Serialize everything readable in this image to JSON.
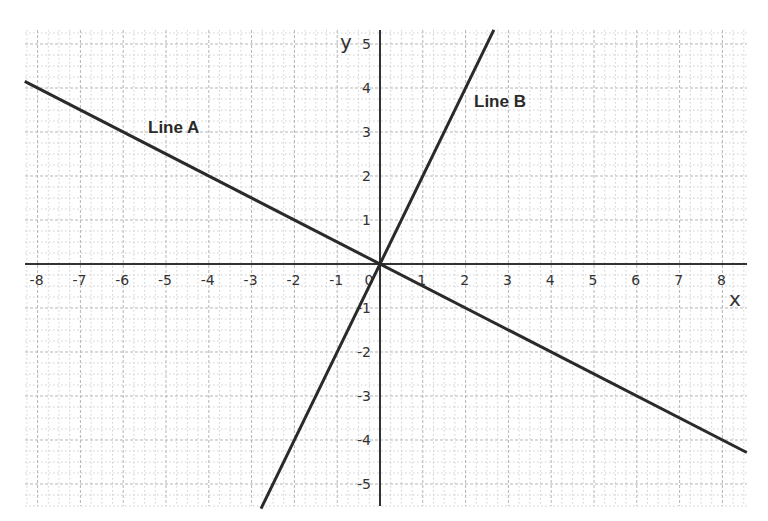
{
  "chart_data": {
    "type": "line",
    "title": "",
    "xlabel": "x",
    "ylabel": "y",
    "xlim": [
      -8.3,
      8.57
    ],
    "ylim": [
      -5.5,
      5.3
    ],
    "grid": true,
    "grid_minor_subdivisions": 4,
    "x_ticks": [
      -8,
      -7,
      -6,
      -5,
      -4,
      -3,
      -2,
      -1,
      0,
      1,
      2,
      3,
      4,
      5,
      6,
      7,
      8
    ],
    "y_ticks": [
      -5,
      -4,
      -3,
      -2,
      -1,
      1,
      2,
      3,
      4,
      5
    ],
    "legend": "none (inline labels)",
    "series": [
      {
        "name": "Line A",
        "equation": "y = -0.5x",
        "slope": -0.5,
        "intercept": 0,
        "x": [
          -8.3,
          8.57
        ],
        "y": [
          4.15,
          -4.285
        ],
        "label_pos": [
          -4.6,
          3.1
        ]
      },
      {
        "name": "Line B",
        "equation": "y = 2x",
        "slope": 2,
        "intercept": 0,
        "x": [
          -2.78,
          2.66
        ],
        "y": [
          -5.56,
          5.32
        ],
        "label_pos": [
          3.0,
          3.8
        ]
      }
    ],
    "annotations": [
      "Line A",
      "Line B"
    ]
  },
  "labels": {
    "x_axis": "x",
    "y_axis": "y",
    "origin": "0",
    "line_a": "Line A",
    "line_b": "Line B"
  },
  "colors": {
    "axis": "#333333",
    "line": "#2a2a2a",
    "major_grid": "#b5b5b5",
    "minor_grid": "#cfcfcf"
  }
}
